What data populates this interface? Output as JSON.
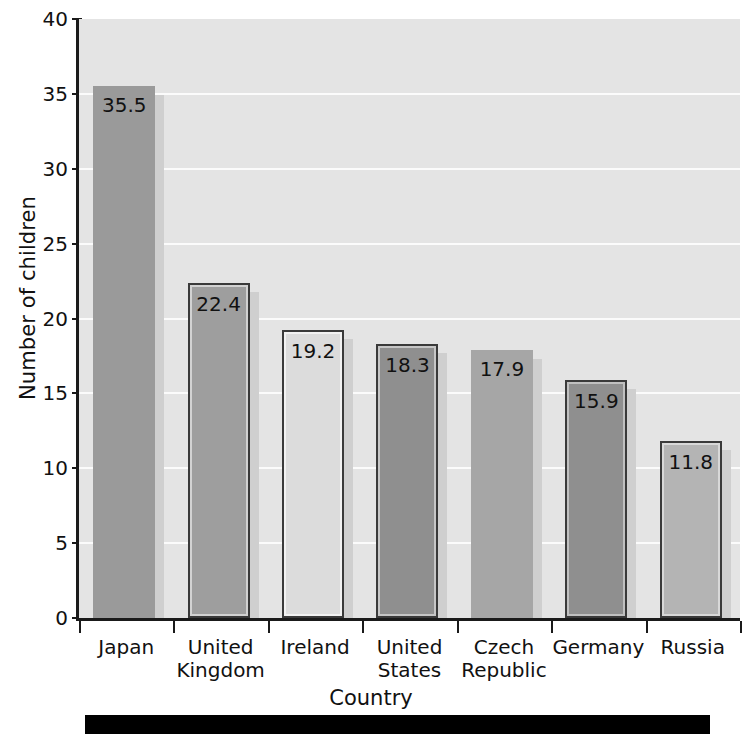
{
  "chart_data": {
    "type": "bar",
    "title": "",
    "xlabel": "Country",
    "ylabel": "Number of children",
    "categories": [
      "Japan",
      "United Kingdom",
      "Ireland",
      "United States",
      "Czech Republic",
      "Germany",
      "Russia"
    ],
    "category_lines": [
      [
        "Japan"
      ],
      [
        "United",
        "Kingdom"
      ],
      [
        "Ireland"
      ],
      [
        "United",
        "States"
      ],
      [
        "Czech",
        "Republic"
      ],
      [
        "Germany"
      ],
      [
        "Russia"
      ]
    ],
    "values": [
      35.5,
      22.4,
      19.2,
      18.3,
      17.9,
      15.9,
      11.8
    ],
    "value_labels": [
      "35.5",
      "22.4",
      "19.2",
      "18.3",
      "17.9",
      "15.9",
      "11.8"
    ],
    "ylim": [
      0,
      40
    ],
    "yticks": [
      0,
      5,
      10,
      15,
      20,
      25,
      30,
      35,
      40
    ],
    "ytick_labels": [
      "0",
      "5",
      "10",
      "15",
      "20",
      "25",
      "30",
      "35",
      "40"
    ],
    "grid": true,
    "grid_orientation": "horizontal",
    "legend": false,
    "bar_styles": [
      {
        "fill": "#9a9a9a",
        "border": "none",
        "inner": "none"
      },
      {
        "fill": "#9e9e9e",
        "border": "#3a3a3a",
        "inner": "#d2d2d2"
      },
      {
        "fill": "#dcdcdc",
        "border": "#3a3a3a",
        "inner": "#f2f2f2"
      },
      {
        "fill": "#8f8f8f",
        "border": "#3a3a3a",
        "inner": "#c6c6c6"
      },
      {
        "fill": "#a6a6a6",
        "border": "none",
        "inner": "none"
      },
      {
        "fill": "#8f8f8f",
        "border": "#3a3a3a",
        "inner": "#c0c0c0"
      },
      {
        "fill": "#b4b4b4",
        "border": "#3a3a3a",
        "inner": "#d8d8d8"
      }
    ],
    "colors": {
      "plot_background": "#e4e4e4",
      "gridline": "#fbfbfb",
      "axis": "#1a1a1a",
      "text": "#111111",
      "shadow": "#cfcfcf",
      "footer_bar": "#000000"
    }
  }
}
